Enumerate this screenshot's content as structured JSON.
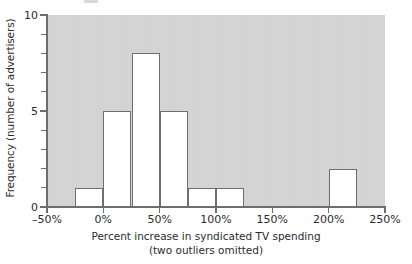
{
  "chart_data": {
    "type": "bar",
    "title": "",
    "subtitle": "",
    "xlabel": "Percent increase in syndicated TV spending",
    "xlabel_line2": "(two outliers omitted)",
    "ylabel": "Frequency (number of advertisers)",
    "xlim": [
      -50,
      250
    ],
    "ylim": [
      0,
      10
    ],
    "bin_width": 25,
    "grid": false,
    "legend": null,
    "xticks": [
      -50,
      0,
      50,
      100,
      150,
      200,
      250
    ],
    "xtick_labels": [
      "–50%",
      "0%",
      "50%",
      "100%",
      "150%",
      "200%",
      "250%"
    ],
    "yticks": [
      0,
      1,
      2,
      3,
      4,
      5,
      6,
      7,
      8,
      9,
      10
    ],
    "ytick_labels": [
      "0",
      "",
      "",
      "",
      "",
      "5",
      "",
      "",
      "",
      "",
      "10"
    ],
    "ytick_major": [
      0,
      5,
      10
    ],
    "bin_edges": [
      -50,
      -25,
      0,
      25,
      50,
      75,
      100,
      125,
      150,
      175,
      200,
      225,
      250
    ],
    "categories": [
      "-50 to -25",
      "-25 to 0",
      "0 to 25",
      "25 to 50",
      "50 to 75",
      "75 to 100",
      "100 to 125",
      "125 to 150",
      "150 to 175",
      "175 to 200",
      "200 to 225",
      "225 to 250"
    ],
    "values": [
      0,
      1,
      5,
      8,
      5,
      1,
      1,
      0,
      0,
      0,
      2,
      0
    ],
    "bars": [
      {
        "x0": -25,
        "x1": 0,
        "value": 1
      },
      {
        "x0": 0,
        "x1": 25,
        "value": 5
      },
      {
        "x0": 25,
        "x1": 50,
        "value": 8
      },
      {
        "x0": 50,
        "x1": 75,
        "value": 5
      },
      {
        "x0": 75,
        "x1": 100,
        "value": 1
      },
      {
        "x0": 100,
        "x1": 125,
        "value": 1
      },
      {
        "x0": 200,
        "x1": 225,
        "value": 2
      }
    ],
    "colors": {
      "plot_background": "#d2d2d2",
      "bar_fill": "#ffffff",
      "bar_edge": "#6e6e6e",
      "axis": "#6d6d6d",
      "text": "#2b2b2b",
      "page_background": "#ffffff"
    }
  }
}
